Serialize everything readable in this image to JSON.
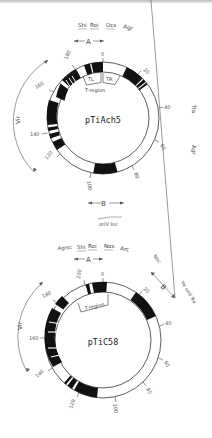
{
  "plasmids": [
    {
      "name": "pTiAch5",
      "top_genes": [
        "Shi",
        "Roi",
        "Ocs",
        "Agr"
      ],
      "region_a_label": "A",
      "region_b_label": "B",
      "t_region_label": "T-region",
      "tl_label": "TL",
      "tr_label": "TR",
      "vir_label": "Vir",
      "right_labels": [
        "Tra",
        "Agr"
      ],
      "bottom_label": "oriV Inc",
      "ticks": [
        "0",
        "20",
        "40",
        "60",
        "80",
        "100",
        "120",
        "140",
        "160",
        "180"
      ]
    },
    {
      "name": "pTiC58",
      "top_genes": [
        "Agrsc",
        "Shi",
        "Roi",
        "Nos",
        "Arc"
      ],
      "region_a_label": "A",
      "region_b_label": "B",
      "t_region_label": "T-region",
      "vir_label": "Vir",
      "right_labels": [
        "Noc",
        "Inc oriV Tra"
      ],
      "ticks": [
        "0",
        "20",
        "40",
        "60",
        "80",
        "100",
        "120",
        "140",
        "160",
        "180",
        "200"
      ]
    }
  ],
  "colors": {
    "fill": "#111111",
    "line": "#333333",
    "text": "#444444"
  }
}
